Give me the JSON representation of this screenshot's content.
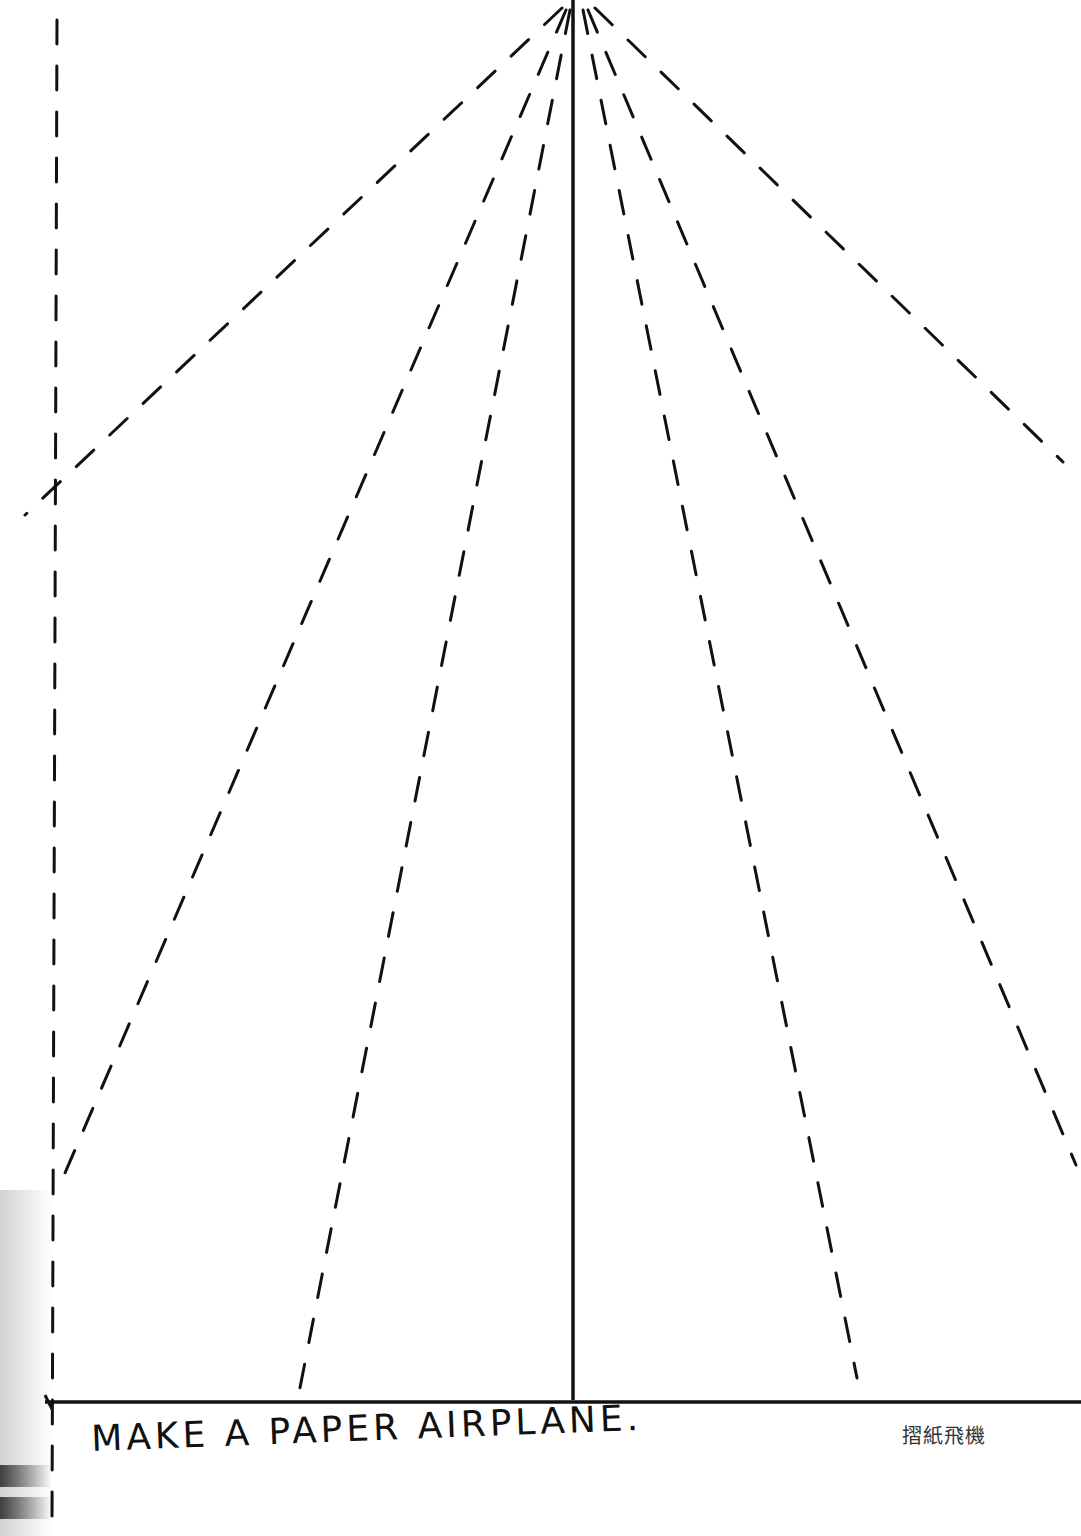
{
  "page": {
    "title": "MAKE A PAPER AIRPLANE.",
    "subtitle": "摺紙飛機",
    "ink_color": "#111111",
    "background": "#ffffff"
  },
  "diagram": {
    "type": "fold-template",
    "apex": [
      576,
      0
    ],
    "solid_lines": [
      {
        "name": "center-fold-line",
        "from": [
          573,
          0
        ],
        "to": [
          573,
          1400
        ]
      },
      {
        "name": "bottom-edge-line",
        "from": [
          45,
          1402
        ],
        "to": [
          1081,
          1402
        ]
      }
    ],
    "dashed_lines": [
      {
        "name": "left-margin-line",
        "from": [
          57,
          20
        ],
        "to": [
          52,
          1525
        ]
      },
      {
        "name": "left-wing-fold-outer",
        "from": [
          562,
          8
        ],
        "to": [
          25,
          515
        ]
      },
      {
        "name": "left-wing-fold-mid",
        "from": [
          566,
          10
        ],
        "to": [
          62,
          1180
        ]
      },
      {
        "name": "left-wing-fold-inner",
        "from": [
          570,
          10
        ],
        "to": [
          298,
          1398
        ]
      },
      {
        "name": "right-wing-fold-inner",
        "from": [
          583,
          10
        ],
        "to": [
          857,
          1378
        ]
      },
      {
        "name": "right-wing-fold-mid",
        "from": [
          588,
          10
        ],
        "to": [
          1076,
          1165
        ]
      },
      {
        "name": "right-wing-fold-outer",
        "from": [
          595,
          8
        ],
        "to": [
          1063,
          462
        ]
      }
    ]
  }
}
